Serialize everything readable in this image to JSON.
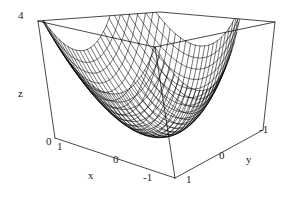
{
  "figure": {
    "kind": "3d-surface-plot",
    "style": "mathematica-wireframe",
    "background_color": "#ffffff",
    "line_color": "#1b1b1b",
    "mesh_color": "#000000"
  },
  "axes": {
    "z": {
      "name": "z",
      "ticks": [
        "0",
        "4"
      ],
      "top_label": "4",
      "bottom_label": "0",
      "range": [
        0,
        4
      ]
    },
    "x": {
      "name": "x",
      "ticks": [
        "1",
        "0",
        "-1"
      ],
      "range": [
        1,
        -1
      ]
    },
    "y": {
      "name": "y",
      "ticks": [
        "1",
        "0",
        "-1"
      ],
      "range": [
        1,
        -1
      ]
    }
  },
  "chart_data": {
    "type": "surface",
    "title": "",
    "xlabel": "x",
    "ylabel": "y",
    "zlabel": "z",
    "xlim": [
      -1,
      1
    ],
    "ylim": [
      -1,
      1
    ],
    "zlim": [
      0,
      4
    ],
    "x_ticks": [
      1,
      0,
      -1
    ],
    "y_ticks": [
      1,
      0,
      -1
    ],
    "z_ticks": [
      0,
      4
    ],
    "grid": false,
    "legend": "none",
    "surface": {
      "expression": "z = 2*(x^2 + y^2)",
      "description": "elliptic paraboloid bowl opening upward, wireframe mesh",
      "mesh_u_lines": 25,
      "mesh_v_lines": 25,
      "z_at_origin": 0,
      "z_at_corner": 4
    },
    "samples": [
      {
        "x": -1,
        "y": -1,
        "z": 4
      },
      {
        "x": -1,
        "y": 0,
        "z": 2
      },
      {
        "x": -1,
        "y": 1,
        "z": 4
      },
      {
        "x": 0,
        "y": -1,
        "z": 2
      },
      {
        "x": 0,
        "y": 0,
        "z": 0
      },
      {
        "x": 0,
        "y": 1,
        "z": 2
      },
      {
        "x": 1,
        "y": -1,
        "z": 4
      },
      {
        "x": 1,
        "y": 0,
        "z": 2
      },
      {
        "x": 1,
        "y": 1,
        "z": 4
      }
    ]
  },
  "labels": {
    "z_name": "z",
    "z_top": "4",
    "z_zero": "0",
    "x_name": "x",
    "x_t1": "1",
    "x_t0": "0",
    "x_tm1": "-1",
    "y_name": "y",
    "y_t1": "1",
    "y_t0": "0",
    "y_tm1": "-1"
  }
}
